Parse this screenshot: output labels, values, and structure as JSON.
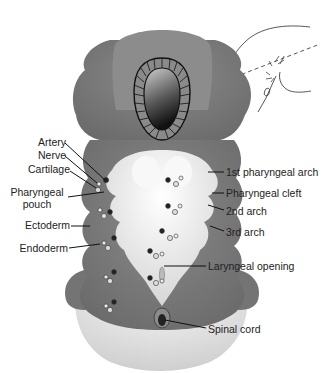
{
  "figure": {
    "left_labels": [
      {
        "id": "artery",
        "text": "Artery"
      },
      {
        "id": "nerve",
        "text": "Nerve"
      },
      {
        "id": "cartilage",
        "text": "Cartilage"
      },
      {
        "id": "pharyngeal-pouch",
        "text": "Pharyngeal\npouch",
        "line1": "Pharyngeal",
        "line2": "pouch"
      },
      {
        "id": "ectoderm",
        "text": "Ectoderm"
      },
      {
        "id": "endoderm",
        "text": "Endoderm"
      }
    ],
    "right_labels": [
      {
        "id": "first-arch",
        "text": "1st pharyngeal arch"
      },
      {
        "id": "pharyngeal-cleft",
        "text": "Pharyngeal cleft"
      },
      {
        "id": "second-arch",
        "text": "2nd arch"
      },
      {
        "id": "third-arch",
        "text": "3rd arch"
      },
      {
        "id": "laryngeal-opening",
        "text": "Laryngeal opening"
      },
      {
        "id": "spinal-cord",
        "text": "Spinal cord"
      }
    ],
    "colors": {
      "tissue": "#7d7d7d",
      "tissue_dark": "#5e5e5e",
      "pharynx": "#e8e8e8",
      "background": "#ffffff",
      "line": "#222222"
    },
    "inset": {
      "description": "Embryo head outline with dashed section plane"
    }
  }
}
